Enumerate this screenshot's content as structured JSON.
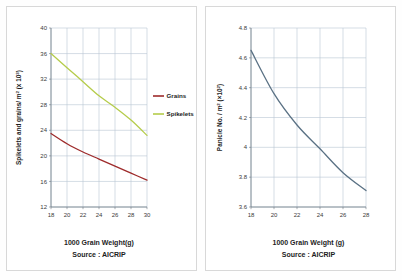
{
  "page": {
    "background_color": "#fefefe",
    "panel_background": "#ffffff",
    "panel_border_color": "#d8d8d8"
  },
  "chart_data": [
    {
      "id": "spikelets-grains-chart",
      "type": "line",
      "title": "",
      "xlabel": "1000 Grain Weight(g)",
      "ylabel": "Spikelets and grains/ m² (x 10³)",
      "ylabel_main": "Spikelets and grains/ m",
      "ylabel_sup1": "2",
      "ylabel_mid": " (x 10",
      "ylabel_sup2": "3",
      "ylabel_end": ")",
      "source": "Source : AICRIP",
      "grid": true,
      "legend_position": "right",
      "xlim": [
        18,
        30
      ],
      "ylim": [
        12,
        40
      ],
      "xticks": [
        "18",
        "20",
        "22",
        "24",
        "26",
        "28",
        "30"
      ],
      "yticks": [
        "12",
        "16",
        "20",
        "24",
        "28",
        "32",
        "36",
        "40"
      ],
      "x": [
        18,
        20,
        22,
        24,
        26,
        28,
        30
      ],
      "series": [
        {
          "name": "Grains",
          "color": "#9e2b2b",
          "values": [
            23.5,
            21.9,
            20.6,
            19.5,
            18.4,
            17.3,
            16.2
          ]
        },
        {
          "name": "Spikelets",
          "color": "#b5cc4a",
          "values": [
            36.0,
            33.8,
            31.6,
            29.4,
            27.6,
            25.6,
            23.2
          ]
        }
      ]
    },
    {
      "id": "panicle-number-chart",
      "type": "line",
      "title": "",
      "xlabel": "1000 Grain Weight (g)",
      "ylabel": "Panicle No. / m² (×10²)",
      "ylabel_main": "Panicle No. / m",
      "ylabel_sup1": "2",
      "ylabel_mid": " (×10",
      "ylabel_sup2": "2",
      "ylabel_end": ")",
      "source": "Source : AICRIP",
      "grid": true,
      "legend_position": "none",
      "xlim": [
        18,
        28
      ],
      "ylim": [
        3.6,
        4.8
      ],
      "xticks": [
        "18",
        "20",
        "22",
        "24",
        "26",
        "28"
      ],
      "yticks": [
        "3.6",
        "3.8",
        "4",
        "4.2",
        "4.4",
        "4.6",
        "4.8"
      ],
      "x": [
        18,
        20,
        22,
        24,
        26,
        28
      ],
      "series": [
        {
          "name": "Panicle No.",
          "color": "#5a7184",
          "values": [
            4.65,
            4.36,
            4.15,
            3.99,
            3.83,
            3.71
          ]
        }
      ]
    }
  ],
  "colors": {
    "grains": "#9e2b2b",
    "spikelets": "#b5cc4a",
    "panicle": "#5a7184",
    "grid": "#b9c6d4",
    "axis": "#6f7b85",
    "tick_text": "#3a3a3a",
    "label_text": "#1d1d1d"
  }
}
